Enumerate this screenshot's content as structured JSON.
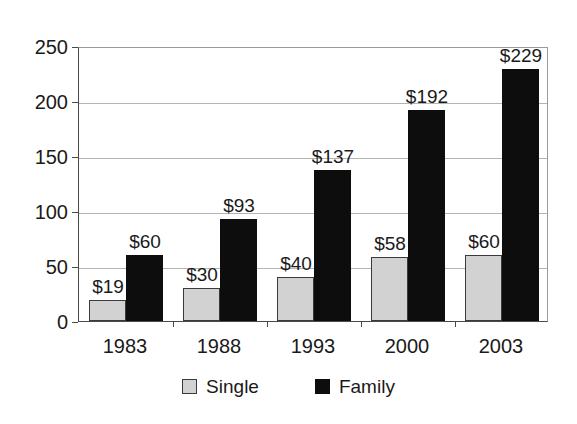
{
  "chart_data": {
    "type": "bar",
    "title": "",
    "subtitle": "",
    "xlabel": "",
    "ylabel": "",
    "categories": [
      "1983",
      "1988",
      "1993",
      "2000",
      "2003"
    ],
    "series": [
      {
        "name": "Single",
        "color": "#d2d2d2",
        "values": [
          19,
          30,
          40,
          58,
          60
        ],
        "labels": [
          "$19",
          "$30",
          "$40",
          "$58",
          "$60"
        ]
      },
      {
        "name": "Family",
        "color": "#0d0d0d",
        "values": [
          60,
          93,
          137,
          192,
          229
        ],
        "labels": [
          "$60",
          "$93",
          "$137",
          "$192",
          "$229"
        ]
      }
    ],
    "ylim": [
      0,
      250
    ],
    "ytick_values": [
      0,
      50,
      100,
      150,
      200,
      250
    ],
    "ytick_labels": [
      "0",
      "50",
      "100",
      "150",
      "200",
      "250"
    ],
    "grid": true,
    "grid_axis": "y",
    "legend_position": "bottom",
    "legend_entries": [
      "Single",
      "Family"
    ]
  },
  "axis": {
    "ticks": [
      {
        "label": "250",
        "value": 250
      },
      {
        "label": "200",
        "value": 200
      },
      {
        "label": "150",
        "value": 150
      },
      {
        "label": "100",
        "value": 100
      },
      {
        "label": "50",
        "value": 50
      },
      {
        "label": "0",
        "value": 0
      }
    ]
  },
  "legend": {
    "single_label": "Single",
    "family_label": "Family"
  },
  "colors": {
    "single_fill": "#d2d2d2",
    "single_border": "#3a3a3a",
    "family_fill": "#0d0d0d",
    "gridline": "#b4b4b4",
    "axis": "#4a4a4a",
    "background": "#ffffff",
    "text": "#1a1a1a"
  }
}
